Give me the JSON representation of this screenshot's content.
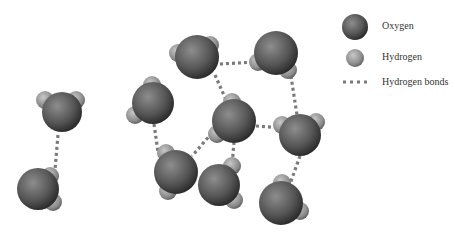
{
  "diagram": {
    "type": "water-molecules-hydrogen-bonding",
    "colors": {
      "oxygen_dark": "#2e2e2e",
      "oxygen_light": "#8a8a8a",
      "hydrogen_dark": "#555555",
      "hydrogen_light": "#bdbdbd",
      "bond": "#7a7a7a"
    },
    "molecules": [
      {
        "id": "m1",
        "o": [
          62,
          112,
          20
        ],
        "h": [
          [
            45,
            100,
            9
          ],
          [
            76,
            100,
            9
          ]
        ]
      },
      {
        "id": "m2",
        "o": [
          38,
          189,
          21
        ],
        "h": [
          [
            50,
            176,
            9
          ],
          [
            53,
            202,
            9
          ]
        ]
      },
      {
        "id": "m3",
        "o": [
          197,
          57,
          22
        ],
        "h": [
          [
            178,
            53,
            9
          ],
          [
            210,
            45,
            9
          ]
        ]
      },
      {
        "id": "m4",
        "o": [
          276,
          53,
          22
        ],
        "h": [
          [
            258,
            62,
            9
          ],
          [
            288,
            70,
            9
          ]
        ]
      },
      {
        "id": "m5",
        "o": [
          153,
          103,
          21
        ],
        "h": [
          [
            152,
            85,
            9
          ],
          [
            135,
            115,
            9
          ]
        ]
      },
      {
        "id": "m6",
        "o": [
          234,
          121,
          22
        ],
        "h": [
          [
            232,
            102,
            9
          ],
          [
            217,
            134,
            9
          ]
        ]
      },
      {
        "id": "m7",
        "o": [
          300,
          135,
          21
        ],
        "h": [
          [
            282,
            125,
            9
          ],
          [
            316,
            122,
            9
          ]
        ]
      },
      {
        "id": "m8",
        "o": [
          176,
          172,
          22
        ],
        "h": [
          [
            166,
            153,
            9
          ],
          [
            168,
            191,
            9
          ]
        ]
      },
      {
        "id": "m9",
        "o": [
          219,
          185,
          21
        ],
        "h": [
          [
            232,
            166,
            9
          ],
          [
            234,
            200,
            9
          ]
        ]
      },
      {
        "id": "m10",
        "o": [
          281,
          203,
          22
        ],
        "h": [
          [
            282,
            183,
            9
          ],
          [
            300,
            211,
            9
          ]
        ]
      }
    ],
    "bonds": [
      [
        58,
        135,
        55,
        170
      ],
      [
        220,
        64,
        256,
        62
      ],
      [
        215,
        75,
        226,
        100
      ],
      [
        290,
        70,
        297,
        115
      ],
      [
        256,
        126,
        281,
        128
      ],
      [
        234,
        142,
        232,
        166
      ],
      [
        212,
        133,
        192,
        156
      ],
      [
        154,
        124,
        158,
        152
      ],
      [
        300,
        156,
        290,
        184
      ]
    ]
  },
  "legend": {
    "items": [
      {
        "label": "Oxygen",
        "kind": "oxygen",
        "symbol": [
          355,
          27,
          13
        ]
      },
      {
        "label": "Hydrogen",
        "kind": "hydrogen",
        "symbol": [
          355,
          58,
          9
        ]
      },
      {
        "label": "Hydrogen bonds",
        "kind": "bond"
      }
    ]
  }
}
